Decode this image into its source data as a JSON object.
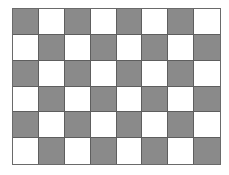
{
  "board": {
    "rows": 6,
    "cols": 8,
    "colors": {
      "dark": "#8a8a8a",
      "light": "#ffffff",
      "grid_line": "#5e5e5e"
    },
    "pattern": [
      [
        "dark",
        "light",
        "dark",
        "light",
        "dark",
        "light",
        "dark",
        "light"
      ],
      [
        "light",
        "dark",
        "light",
        "dark",
        "light",
        "dark",
        "light",
        "dark"
      ],
      [
        "dark",
        "light",
        "dark",
        "light",
        "dark",
        "light",
        "dark",
        "light"
      ],
      [
        "light",
        "dark",
        "light",
        "dark",
        "light",
        "dark",
        "light",
        "dark"
      ],
      [
        "dark",
        "light",
        "dark",
        "light",
        "dark",
        "light",
        "dark",
        "light"
      ],
      [
        "light",
        "dark",
        "light",
        "dark",
        "light",
        "dark",
        "light",
        "dark"
      ]
    ]
  }
}
